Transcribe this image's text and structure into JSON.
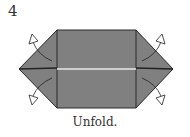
{
  "step_number": "4",
  "caption": "Unfold.",
  "colors": {
    "paper": "#808080",
    "outline": "#2a2a2a",
    "center_line": "#e8e8e8",
    "background": "#ffffff"
  }
}
